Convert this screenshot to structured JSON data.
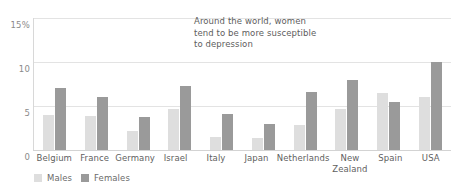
{
  "chart_data": {
    "type": "bar",
    "title": "",
    "subtitle": "",
    "xlabel": "",
    "ylabel": "",
    "ylim": [
      0,
      15
    ],
    "yticks": [
      "0",
      "5",
      "10",
      "15%"
    ],
    "ytick_values": [
      0,
      5,
      10,
      15
    ],
    "grid": true,
    "legend_position": "bottom-left",
    "annotation": "Around the world, women\ntend to be more susceptible\nto depression",
    "categories": [
      "Belgium",
      "France",
      "Germany",
      "Israel",
      "Italy",
      "Japan",
      "Netherlands",
      "New\nZealand",
      "Spain",
      "USA"
    ],
    "series": [
      {
        "name": "Males",
        "color": "#dedede",
        "values": [
          4.0,
          3.9,
          2.2,
          4.7,
          1.5,
          1.4,
          2.8,
          4.7,
          6.5,
          6.0
        ]
      },
      {
        "name": "Females",
        "color": "#9a9a9a",
        "values": [
          7.0,
          6.0,
          3.7,
          7.3,
          4.1,
          2.9,
          6.6,
          8.0,
          5.5,
          10.0
        ]
      }
    ]
  },
  "colors": {
    "males": "#dedede",
    "females": "#9a9a9a",
    "gridline": "#e3e3e3",
    "axis": "#d3d3d3",
    "text": "#5f5f5f"
  }
}
